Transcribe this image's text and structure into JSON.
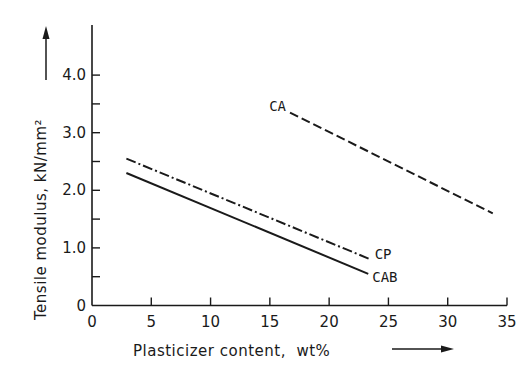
{
  "chart_data": {
    "type": "line",
    "title": "",
    "xlabel": "Plasticizer content,  wt%",
    "ylabel": "Tensile modulus,  kN/mm²",
    "xlim": [
      0,
      35
    ],
    "ylim": [
      0,
      4.8
    ],
    "x_ticks": [
      0,
      5,
      10,
      15,
      20,
      25,
      30,
      35
    ],
    "x_tick_labels": [
      "0",
      "5",
      "10",
      "15",
      "20",
      "25",
      "30",
      "35"
    ],
    "y_ticks": [
      0,
      1.0,
      2.0,
      3.0,
      4.0
    ],
    "y_tick_labels": [
      "0",
      "1.0",
      "2.0",
      "3.0",
      "4.0"
    ],
    "y_minor_ticks": [
      0.5,
      1.5,
      2.5,
      3.5
    ],
    "grid": false,
    "legend": "inline labels at line ends",
    "series": [
      {
        "name": "CA",
        "style": "dashed",
        "x": [
          16.7,
          33.8
        ],
        "values": [
          3.35,
          1.6
        ],
        "label_at": "start"
      },
      {
        "name": "CP",
        "style": "dash-dot",
        "x": [
          2.9,
          23.5
        ],
        "values": [
          2.55,
          0.8
        ],
        "label_at": "end"
      },
      {
        "name": "CAB",
        "style": "solid",
        "x": [
          2.9,
          23.3
        ],
        "values": [
          2.3,
          0.55
        ],
        "label_at": "end"
      }
    ],
    "colors": {
      "line": "#1a1a1a",
      "background": "#ffffff"
    }
  }
}
